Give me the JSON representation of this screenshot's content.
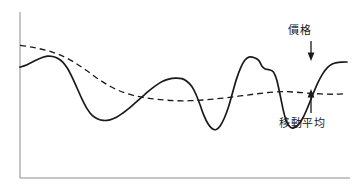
{
  "chart_data": {
    "type": "line",
    "title": "",
    "subtitle": "",
    "xlabel": "",
    "ylabel": "",
    "grid": false,
    "legend_position": "inline-annotations",
    "axis": {
      "x_axis_visible": true,
      "y_axis_visible": true,
      "x_tick_labels": [],
      "y_tick_labels": [],
      "xlim": [
        0,
        100
      ],
      "ylim": [
        0,
        100
      ]
    },
    "series": [
      {
        "name": "價格",
        "style": "solid",
        "color": "#1a1a1a",
        "points": [
          [
            0.0,
            72.8
          ],
          [
            2.2,
            74.5
          ],
          [
            4.5,
            77.2
          ],
          [
            6.8,
            79.5
          ],
          [
            8.5,
            80.4
          ],
          [
            10.0,
            80.2
          ],
          [
            11.5,
            79.0
          ],
          [
            13.0,
            76.5
          ],
          [
            14.5,
            72.0
          ],
          [
            16.0,
            65.5
          ],
          [
            17.5,
            58.0
          ],
          [
            19.0,
            50.5
          ],
          [
            20.5,
            44.0
          ],
          [
            22.0,
            39.5
          ],
          [
            23.8,
            36.8
          ],
          [
            25.5,
            35.8
          ],
          [
            27.5,
            36.2
          ],
          [
            29.5,
            38.0
          ],
          [
            31.5,
            41.0
          ],
          [
            33.5,
            44.5
          ],
          [
            35.5,
            48.5
          ],
          [
            37.5,
            52.5
          ],
          [
            39.5,
            56.5
          ],
          [
            41.5,
            60.0
          ],
          [
            43.5,
            62.8
          ],
          [
            45.5,
            64.5
          ],
          [
            47.5,
            65.2
          ],
          [
            49.5,
            64.8
          ],
          [
            51.0,
            63.0
          ],
          [
            52.5,
            59.5
          ],
          [
            53.8,
            54.0
          ],
          [
            55.0,
            47.0
          ],
          [
            56.2,
            39.5
          ],
          [
            57.5,
            33.5
          ],
          [
            58.8,
            30.0
          ],
          [
            60.0,
            29.5
          ],
          [
            61.2,
            32.0
          ],
          [
            62.5,
            37.5
          ],
          [
            63.8,
            45.5
          ],
          [
            65.0,
            55.0
          ],
          [
            66.2,
            64.5
          ],
          [
            67.5,
            72.5
          ],
          [
            68.8,
            77.8
          ],
          [
            70.0,
            79.8
          ],
          [
            71.5,
            79.5
          ],
          [
            73.0,
            77.5
          ],
          [
            74.0,
            73.5
          ],
          [
            75.0,
            71.5
          ],
          [
            76.2,
            71.0
          ],
          [
            77.5,
            69.5
          ],
          [
            78.5,
            64.0
          ],
          [
            79.5,
            54.0
          ],
          [
            80.5,
            43.0
          ],
          [
            81.5,
            35.0
          ],
          [
            82.5,
            31.5
          ],
          [
            83.5,
            30.5
          ],
          [
            85.0,
            32.5
          ],
          [
            86.5,
            37.5
          ],
          [
            88.0,
            45.0
          ],
          [
            89.5,
            53.5
          ],
          [
            91.0,
            61.5
          ],
          [
            92.5,
            68.0
          ],
          [
            94.0,
            72.5
          ],
          [
            95.5,
            75.0
          ],
          [
            97.0,
            76.0
          ],
          [
            98.5,
            76.3
          ],
          [
            100.0,
            76.4
          ]
        ]
      },
      {
        "name": "移動平均",
        "style": "dashed",
        "color": "#1a1a1a",
        "dash_pattern": [
          6,
          4
        ],
        "points": [
          [
            0.0,
            88.0
          ],
          [
            4.0,
            86.5
          ],
          [
            8.0,
            84.5
          ],
          [
            12.0,
            81.5
          ],
          [
            16.0,
            77.0
          ],
          [
            20.0,
            71.0
          ],
          [
            24.0,
            64.5
          ],
          [
            28.0,
            59.0
          ],
          [
            32.0,
            55.0
          ],
          [
            36.0,
            52.5
          ],
          [
            40.0,
            51.0
          ],
          [
            44.0,
            50.0
          ],
          [
            48.0,
            49.5
          ],
          [
            52.0,
            49.5
          ],
          [
            56.0,
            50.0
          ],
          [
            60.0,
            50.8
          ],
          [
            64.0,
            51.8
          ],
          [
            68.0,
            53.0
          ],
          [
            72.0,
            54.2
          ],
          [
            76.0,
            55.2
          ],
          [
            80.0,
            55.8
          ],
          [
            84.0,
            55.5
          ],
          [
            88.0,
            54.8
          ],
          [
            92.0,
            54.2
          ],
          [
            96.0,
            54.0
          ],
          [
            100.0,
            54.3
          ]
        ]
      }
    ],
    "annotations": [
      {
        "name": "price",
        "label": "價格",
        "target_series": "價格",
        "arrow_direction": "down"
      },
      {
        "name": "moving-average",
        "label": "移動平均",
        "target_series": "移動平均",
        "arrow_direction": "up"
      }
    ]
  },
  "annotations": {
    "price_label": "價格",
    "moving_average_label": "移動平均"
  },
  "colors": {
    "line": "#1a1a1a",
    "axis": "#8c8c8c",
    "background": "#ffffff",
    "text": "#1a1a1a"
  }
}
